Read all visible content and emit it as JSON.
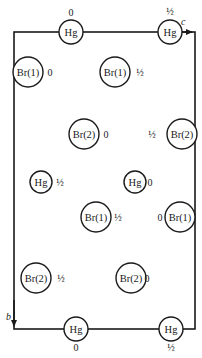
{
  "diagram": {
    "type": "crystal-structure-projection",
    "frame": {
      "left": 14,
      "top": 32,
      "right": 195,
      "bottom": 329,
      "color": "#1a1a1a"
    },
    "axes": [
      {
        "label": "c",
        "x": 181,
        "y": 25,
        "arrow": {
          "x1": 178,
          "y1": 32,
          "x2": 192,
          "y2": 32
        }
      },
      {
        "label": "b",
        "x": 6,
        "y": 320,
        "arrow": {
          "x1": 14,
          "y1": 300,
          "x2": 14,
          "y2": 326
        }
      }
    ],
    "atoms": [
      {
        "id": "hg-top-1",
        "label": "Hg",
        "height": "0",
        "cx": 71,
        "cy": 32,
        "r": 12,
        "hx": 71,
        "hy": 16
      },
      {
        "id": "hg-top-2",
        "label": "Hg",
        "height": "½",
        "cx": 170,
        "cy": 32,
        "r": 12,
        "hx": 170,
        "hy": 15
      },
      {
        "id": "br1-a",
        "label": "Br(1)",
        "height": "0",
        "cx": 28,
        "cy": 72,
        "r": 15,
        "hx": 50,
        "hy": 76
      },
      {
        "id": "br1-b",
        "label": "Br(1)",
        "height": "½",
        "cx": 115,
        "cy": 72,
        "r": 15,
        "hx": 140,
        "hy": 76
      },
      {
        "id": "br2-a",
        "label": "Br(2)",
        "height": "0",
        "cx": 84,
        "cy": 134,
        "r": 15,
        "hx": 106,
        "hy": 138
      },
      {
        "id": "br2-b",
        "label": "Br(2)",
        "height": "½",
        "cx": 182,
        "cy": 134,
        "r": 15,
        "hx": 152,
        "hy": 138
      },
      {
        "id": "hg-mid-1",
        "label": "Hg",
        "height": "½",
        "cx": 41,
        "cy": 182,
        "r": 11,
        "hx": 60,
        "hy": 186
      },
      {
        "id": "hg-mid-2",
        "label": "Hg",
        "height": "0",
        "cx": 135,
        "cy": 182,
        "r": 11,
        "hx": 150,
        "hy": 186
      },
      {
        "id": "br1-c",
        "label": "Br(1)",
        "height": "½",
        "cx": 96,
        "cy": 217,
        "r": 15,
        "hx": 118,
        "hy": 221
      },
      {
        "id": "br1-d",
        "label": "Br(1)",
        "height": "0",
        "cx": 180,
        "cy": 217,
        "r": 15,
        "hx": 160,
        "hy": 221
      },
      {
        "id": "br2-c",
        "label": "Br(2)",
        "height": "½",
        "cx": 36,
        "cy": 278,
        "r": 15,
        "hx": 61,
        "hy": 282
      },
      {
        "id": "br2-d",
        "label": "Br(2)",
        "height": "0",
        "cx": 131,
        "cy": 278,
        "r": 15,
        "hx": 147,
        "hy": 282
      },
      {
        "id": "hg-bot-1",
        "label": "Hg",
        "height": "0",
        "cx": 76,
        "cy": 329,
        "r": 12,
        "hx": 76,
        "hy": 351
      },
      {
        "id": "hg-bot-2",
        "label": "Hg",
        "height": "½",
        "cx": 171,
        "cy": 329,
        "r": 12,
        "hx": 171,
        "hy": 351
      }
    ]
  }
}
